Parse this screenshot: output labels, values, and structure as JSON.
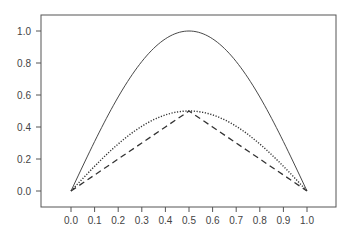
{
  "chart_data": {
    "type": "line",
    "title": "",
    "xlabel": "",
    "ylabel": "",
    "xlim": [
      -0.13,
      1.12
    ],
    "ylim": [
      -0.1,
      1.1
    ],
    "grid": false,
    "legend": null,
    "x_ticks": [
      "0.0",
      "0.1",
      "0.2",
      "0.3",
      "0.4",
      "0.5",
      "0.6",
      "0.7",
      "0.8",
      "0.9",
      "1.0"
    ],
    "y_ticks": [
      "0.0",
      "0.2",
      "0.4",
      "0.6",
      "0.8",
      "1.0"
    ],
    "x": [
      0.0,
      0.1,
      0.2,
      0.25,
      0.3,
      0.4,
      0.5,
      0.6,
      0.7,
      0.75,
      0.8,
      0.9,
      1.0
    ],
    "series": [
      {
        "name": "solid",
        "style": "solid",
        "values": [
          0.0,
          0.309,
          0.588,
          0.707,
          0.809,
          0.951,
          1.0,
          0.951,
          0.809,
          0.707,
          0.588,
          0.309,
          0.0
        ]
      },
      {
        "name": "dotted",
        "style": "dotted",
        "values": [
          0.0,
          0.155,
          0.294,
          0.354,
          0.405,
          0.476,
          0.5,
          0.476,
          0.405,
          0.354,
          0.294,
          0.155,
          0.0
        ]
      },
      {
        "name": "dashed",
        "style": "dashed",
        "values": [
          0.0,
          0.1,
          0.2,
          0.25,
          0.3,
          0.4,
          0.5,
          0.4,
          0.3,
          0.25,
          0.2,
          0.1,
          0.0
        ]
      }
    ]
  },
  "colors": {
    "line": "#333333",
    "axis": "#555555",
    "text": "#444444"
  }
}
